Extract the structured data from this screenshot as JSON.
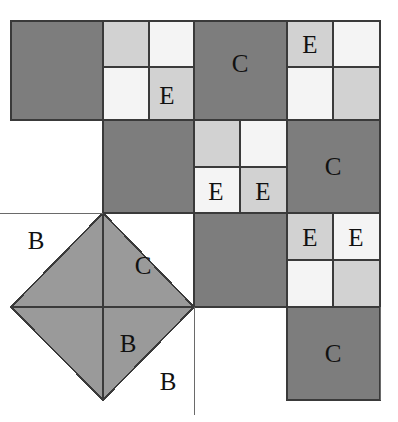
{
  "figure": {
    "width": 398,
    "height": 422,
    "background": "#ffffff"
  },
  "palette": {
    "dark_gray": "#7d7d7d",
    "mid_gray": "#9a9a9a",
    "light_gray": "#d2d2d2",
    "pale_gray": "#ececec",
    "near_white": "#f4f4f4",
    "white": "#ffffff",
    "stroke": "#3a3a3a",
    "text": "#111111"
  },
  "grid": {
    "x_lines": [
      11,
      57,
      103,
      149,
      194,
      240,
      287,
      333,
      380
    ],
    "y_lines": [
      21,
      67,
      120,
      167,
      213,
      260,
      307,
      353,
      400
    ],
    "cell_w": 46,
    "cell_h": 47
  },
  "cells": [
    {
      "name": "cell-r0c0",
      "x": 11,
      "y": 21,
      "w": 92,
      "h": 99,
      "fill": "#7d7d7d",
      "stroke": true
    },
    {
      "name": "cell-r0c2",
      "x": 103,
      "y": 21,
      "w": 46,
      "h": 46,
      "fill": "#d2d2d2",
      "stroke": true
    },
    {
      "name": "cell-r0c3",
      "x": 149,
      "y": 21,
      "w": 45,
      "h": 46,
      "fill": "#f4f4f4",
      "stroke": true
    },
    {
      "name": "cell-r1c2",
      "x": 103,
      "y": 67,
      "w": 46,
      "h": 53,
      "fill": "#f4f4f4",
      "stroke": true
    },
    {
      "name": "cell-r1c3",
      "x": 149,
      "y": 67,
      "w": 45,
      "h": 53,
      "fill": "#d2d2d2",
      "stroke": true
    },
    {
      "name": "cell-c-top",
      "x": 194,
      "y": 21,
      "w": 93,
      "h": 99,
      "fill": "#7d7d7d",
      "stroke": true
    },
    {
      "name": "cell-e-top",
      "x": 287,
      "y": 21,
      "w": 46,
      "h": 46,
      "fill": "#d2d2d2",
      "stroke": true
    },
    {
      "name": "cell-r0c7",
      "x": 333,
      "y": 21,
      "w": 47,
      "h": 46,
      "fill": "#f4f4f4",
      "stroke": true
    },
    {
      "name": "cell-r1c6",
      "x": 287,
      "y": 67,
      "w": 46,
      "h": 53,
      "fill": "#f4f4f4",
      "stroke": true
    },
    {
      "name": "cell-r1c7",
      "x": 333,
      "y": 67,
      "w": 47,
      "h": 53,
      "fill": "#d2d2d2",
      "stroke": true
    },
    {
      "name": "cell-mid-dark",
      "x": 103,
      "y": 120,
      "w": 91,
      "h": 93,
      "fill": "#7d7d7d",
      "stroke": true
    },
    {
      "name": "cell-r2c4",
      "x": 194,
      "y": 120,
      "w": 46,
      "h": 47,
      "fill": "#d2d2d2",
      "stroke": true
    },
    {
      "name": "cell-r2c5",
      "x": 240,
      "y": 120,
      "w": 47,
      "h": 47,
      "fill": "#f4f4f4",
      "stroke": true
    },
    {
      "name": "cell-e-mid-left",
      "x": 194,
      "y": 167,
      "w": 46,
      "h": 46,
      "fill": "#f4f4f4",
      "stroke": true
    },
    {
      "name": "cell-e-mid-right",
      "x": 240,
      "y": 167,
      "w": 47,
      "h": 46,
      "fill": "#d2d2d2",
      "stroke": true
    },
    {
      "name": "cell-c-right",
      "x": 287,
      "y": 120,
      "w": 93,
      "h": 93,
      "fill": "#7d7d7d",
      "stroke": true
    },
    {
      "name": "cell-lower-dark",
      "x": 194,
      "y": 213,
      "w": 93,
      "h": 94,
      "fill": "#7d7d7d",
      "stroke": true
    },
    {
      "name": "cell-e-low-left",
      "x": 287,
      "y": 213,
      "w": 46,
      "h": 47,
      "fill": "#d2d2d2",
      "stroke": true
    },
    {
      "name": "cell-e-low-right",
      "x": 333,
      "y": 213,
      "w": 47,
      "h": 47,
      "fill": "#f4f4f4",
      "stroke": true
    },
    {
      "name": "cell-r5c6",
      "x": 287,
      "y": 260,
      "w": 46,
      "h": 47,
      "fill": "#f4f4f4",
      "stroke": true
    },
    {
      "name": "cell-r5c7",
      "x": 333,
      "y": 260,
      "w": 47,
      "h": 47,
      "fill": "#d2d2d2",
      "stroke": true
    },
    {
      "name": "cell-c-bottom",
      "x": 287,
      "y": 307,
      "w": 93,
      "h": 93,
      "fill": "#7d7d7d",
      "stroke": true
    }
  ],
  "diamond": {
    "name": "rotated-square-diamond",
    "fill": "#9a9a9a",
    "points": "103,213 194,307 103,400 11,307"
  },
  "diamond_internal_lines": [
    {
      "name": "diamond-horizontal-diagonal",
      "x1": 11,
      "y1": 307,
      "x2": 194,
      "y2": 307
    },
    {
      "name": "diamond-vertical-diagonal",
      "x1": 103,
      "y1": 213,
      "x2": 103,
      "y2": 400
    }
  ],
  "thin_guides": [
    {
      "name": "guide-left-horizontal",
      "x1": 0,
      "y1": 213,
      "x2": 103,
      "y2": 213
    },
    {
      "name": "guide-bottom-vertical",
      "x1": 194,
      "y1": 307,
      "x2": 194,
      "y2": 415
    },
    {
      "name": "guide-right-vertical",
      "x1": 380,
      "y1": 307,
      "x2": 380,
      "y2": 400
    }
  ],
  "labels": [
    {
      "name": "label-E-top-left",
      "text": "E",
      "x": 167,
      "y": 95
    },
    {
      "name": "label-C-top",
      "text": "C",
      "x": 240,
      "y": 63
    },
    {
      "name": "label-E-top-right",
      "text": "E",
      "x": 310,
      "y": 44
    },
    {
      "name": "label-E-mid-left",
      "text": "E",
      "x": 216,
      "y": 191
    },
    {
      "name": "label-E-mid-right",
      "text": "E",
      "x": 263,
      "y": 191
    },
    {
      "name": "label-C-right",
      "text": "C",
      "x": 333,
      "y": 166
    },
    {
      "name": "label-E-low-left",
      "text": "E",
      "x": 310,
      "y": 237
    },
    {
      "name": "label-E-low-right",
      "text": "E",
      "x": 356,
      "y": 237
    },
    {
      "name": "label-B-upper-left",
      "text": "B",
      "x": 36,
      "y": 240
    },
    {
      "name": "label-C-diamond",
      "text": "C",
      "x": 143,
      "y": 265
    },
    {
      "name": "label-B-diamond",
      "text": "B",
      "x": 128,
      "y": 343
    },
    {
      "name": "label-B-outer",
      "text": "B",
      "x": 168,
      "y": 381
    },
    {
      "name": "label-C-bottom",
      "text": "C",
      "x": 333,
      "y": 353
    }
  ]
}
